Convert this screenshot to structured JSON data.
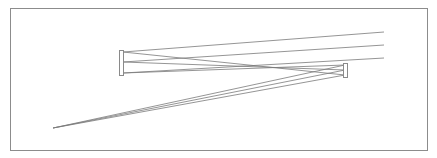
{
  "diagram": {
    "type": "optical-ray-trace",
    "frame": {
      "x": 10,
      "y": 8,
      "width": 417,
      "height": 142,
      "stroke": "#8c8c8c"
    },
    "colors": {
      "ray": "#7a7a7a",
      "mirror": "#8a8a8a",
      "background": "#ffffff"
    },
    "mirrors": [
      {
        "name": "primary-mirror",
        "x": 119,
        "y": 50,
        "width": 4,
        "height": 25
      },
      {
        "name": "secondary-mirror",
        "x": 343,
        "y": 63,
        "width": 4,
        "height": 14
      }
    ],
    "rays": [
      {
        "name": "ray-top",
        "points": [
          [
            384,
            32
          ],
          [
            123,
            52
          ],
          [
            345,
            75
          ],
          [
            53,
            128
          ]
        ]
      },
      {
        "name": "ray-middle",
        "points": [
          [
            384,
            45
          ],
          [
            123,
            62
          ],
          [
            345,
            70
          ],
          [
            53,
            128
          ]
        ]
      },
      {
        "name": "ray-bottom",
        "points": [
          [
            384,
            58
          ],
          [
            123,
            73
          ],
          [
            345,
            65
          ],
          [
            53,
            128
          ]
        ]
      }
    ],
    "focus": {
      "x": 53,
      "y": 128
    }
  }
}
